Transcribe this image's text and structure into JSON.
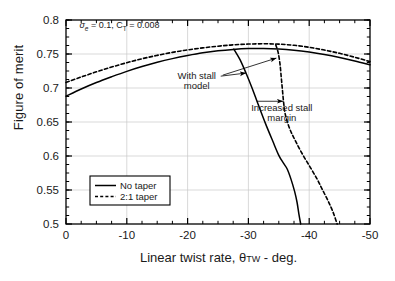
{
  "chart_data": {
    "type": "line",
    "title": "",
    "xlabel": "Linear twist rate, θTW - deg.",
    "ylabel": "Figure of merit",
    "xlim": [
      0,
      -50
    ],
    "ylim": [
      0.5,
      0.8
    ],
    "x_ticks": [
      0,
      -10,
      -20,
      -30,
      -40,
      -50
    ],
    "x_tick_labels": [
      "0",
      "-10",
      "-20",
      "-30",
      "-40",
      "-50"
    ],
    "y_ticks": [
      0.5,
      0.55,
      0.6,
      0.65,
      0.7,
      0.75,
      0.8
    ],
    "y_tick_labels": [
      "0.5",
      "0.55",
      "0.6",
      "0.65",
      "0.7",
      "0.75",
      "0.8"
    ],
    "x_minor_interval": 2.5,
    "y_minor_interval": 0.0125,
    "grid": true,
    "grid_color": "#c8c8c8",
    "axis_color": "#000000",
    "legend_position": "lower left",
    "legend_entries": [
      {
        "label": "No taper",
        "style": "solid"
      },
      {
        "label": "2:1 taper",
        "style": "dashed"
      }
    ],
    "series": [
      {
        "name": "No taper",
        "style": "solid",
        "color": "#000000",
        "points": [
          [
            0,
            0.688
          ],
          [
            -2.5,
            0.6985
          ],
          [
            -5,
            0.708
          ],
          [
            -7.5,
            0.7165
          ],
          [
            -10,
            0.7245
          ],
          [
            -12.5,
            0.7315
          ],
          [
            -15,
            0.7378
          ],
          [
            -17.5,
            0.7432
          ],
          [
            -20,
            0.7478
          ],
          [
            -22.5,
            0.7518
          ],
          [
            -25,
            0.7548
          ],
          [
            -27.5,
            0.7568
          ],
          [
            -30,
            0.758
          ],
          [
            -32.5,
            0.7582
          ],
          [
            -35,
            0.7574
          ],
          [
            -37.5,
            0.7556
          ],
          [
            -40,
            0.7528
          ],
          [
            -42.5,
            0.7492
          ],
          [
            -45,
            0.7448
          ],
          [
            -47.5,
            0.7398
          ],
          [
            -50,
            0.7342
          ]
        ]
      },
      {
        "name": "2:1 taper",
        "style": "dashed",
        "color": "#000000",
        "points": [
          [
            0,
            0.7082
          ],
          [
            -2.5,
            0.7162
          ],
          [
            -5,
            0.7238
          ],
          [
            -7.5,
            0.7308
          ],
          [
            -10,
            0.7372
          ],
          [
            -12.5,
            0.743
          ],
          [
            -15,
            0.748
          ],
          [
            -17.5,
            0.7524
          ],
          [
            -20,
            0.756
          ],
          [
            -22.5,
            0.759
          ],
          [
            -25,
            0.7615
          ],
          [
            -27.5,
            0.7634
          ],
          [
            -30,
            0.7646
          ],
          [
            -32.5,
            0.765
          ],
          [
            -35,
            0.7645
          ],
          [
            -37.5,
            0.7628
          ],
          [
            -40,
            0.7598
          ],
          [
            -42.5,
            0.7558
          ],
          [
            -45,
            0.751
          ],
          [
            -47.5,
            0.7452
          ],
          [
            -50,
            0.7388
          ]
        ]
      },
      {
        "name": "No taper with stall model",
        "style": "solid",
        "color": "#000000",
        "points": [
          [
            -27.6,
            0.7572
          ],
          [
            -28.6,
            0.742
          ],
          [
            -29.6,
            0.722
          ],
          [
            -30.6,
            0.7
          ],
          [
            -31.6,
            0.676
          ],
          [
            -32.8,
            0.648
          ],
          [
            -34.0,
            0.622
          ],
          [
            -35.0,
            0.601
          ],
          [
            -35.8,
            0.589
          ],
          [
            -36.4,
            0.5805
          ],
          [
            -37.0,
            0.566
          ],
          [
            -37.6,
            0.548
          ],
          [
            -38.0,
            0.532
          ],
          [
            -38.3,
            0.515
          ],
          [
            -38.6,
            0.5
          ]
        ]
      },
      {
        "name": "2:1 taper with stall model",
        "style": "dashed",
        "color": "#000000",
        "points": [
          [
            -34.5,
            0.7635
          ],
          [
            -34.9,
            0.752
          ],
          [
            -35.2,
            0.735
          ],
          [
            -35.4,
            0.716
          ],
          [
            -35.6,
            0.697
          ],
          [
            -35.8,
            0.678
          ],
          [
            -36.1,
            0.66
          ],
          [
            -36.8,
            0.64
          ],
          [
            -37.8,
            0.621
          ],
          [
            -39.0,
            0.601
          ],
          [
            -40.2,
            0.583
          ],
          [
            -41.3,
            0.566
          ],
          [
            -42.2,
            0.55
          ],
          [
            -43.1,
            0.534
          ],
          [
            -43.9,
            0.518
          ],
          [
            -44.6,
            0.5
          ]
        ]
      }
    ],
    "annotations": [
      {
        "name": "parameters",
        "text_parts": {
          "sigma": "σ",
          "sigma_sub": "e",
          "mid": " = 0.1, C",
          "ct_sub": "T",
          "tail": " = 0.008"
        },
        "x": -2.2,
        "y": 0.788
      },
      {
        "name": "with-stall-model",
        "line1": "With stall",
        "line2": "model",
        "x": -21.5,
        "y": 0.713
      },
      {
        "name": "increased-stall-margin",
        "line1": "Increased stall",
        "line2": "margin",
        "x": -35.5,
        "y": 0.666
      }
    ]
  },
  "legend": {
    "items": [
      {
        "label": "No taper"
      },
      {
        "label": "2:1 taper"
      }
    ]
  },
  "axes": {
    "ylabel": "Figure of merit",
    "xlabel_prefix": "Linear twist rate, ",
    "xlabel_symbol": "θ",
    "xlabel_sub": "TW",
    "xlabel_suffix": " - deg."
  }
}
